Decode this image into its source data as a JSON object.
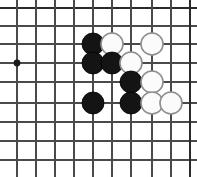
{
  "figure": {
    "board_type": "go-goban",
    "background_color": "#ffffff",
    "line_color": "#4a4a4a",
    "edge_line_color": "#2b2b2b",
    "black_stone_color": "#141414",
    "white_stone_color": "#fbfbfb",
    "white_stone_outline_color": "#8e8e8e",
    "star_point_color": "#1a1a1a"
  },
  "board": {
    "columns_px": [
      17,
      36,
      55,
      74,
      93,
      112,
      131,
      152,
      171,
      190
    ],
    "rows_px": [
      8,
      26,
      44,
      63,
      82,
      103,
      122,
      141,
      160
    ],
    "cell_size_px": 19,
    "stone_radius_px": 11,
    "edges": {
      "top": true,
      "right": true,
      "left": false,
      "bottom": false
    },
    "star_points": [
      {
        "name": "star-point-left",
        "cx": 17,
        "cy": 63,
        "r": 3.4
      }
    ]
  },
  "stones": [
    {
      "name": "stone-black-1",
      "color": "black",
      "cx": 93,
      "cy": 44
    },
    {
      "name": "stone-white-1",
      "color": "white",
      "cx": 112,
      "cy": 44
    },
    {
      "name": "stone-white-2",
      "color": "white",
      "cx": 152,
      "cy": 44
    },
    {
      "name": "stone-black-2",
      "color": "black",
      "cx": 93,
      "cy": 63
    },
    {
      "name": "stone-black-3",
      "color": "black",
      "cx": 112,
      "cy": 63
    },
    {
      "name": "stone-white-3",
      "color": "white",
      "cx": 131,
      "cy": 63
    },
    {
      "name": "stone-black-4",
      "color": "black",
      "cx": 131,
      "cy": 82
    },
    {
      "name": "stone-white-4",
      "color": "white",
      "cx": 152,
      "cy": 82
    },
    {
      "name": "stone-black-5",
      "color": "black",
      "cx": 93,
      "cy": 103
    },
    {
      "name": "stone-black-6",
      "color": "black",
      "cx": 131,
      "cy": 103
    },
    {
      "name": "stone-white-5",
      "color": "white",
      "cx": 152,
      "cy": 103
    },
    {
      "name": "stone-white-6",
      "color": "white",
      "cx": 171,
      "cy": 103
    }
  ],
  "counts": {
    "black_stones": 6,
    "white_stones": 6,
    "total_stones": 12
  }
}
